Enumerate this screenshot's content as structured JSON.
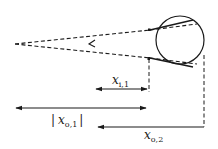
{
  "diagram": {
    "type": "optics-ray-diagram",
    "elements": {
      "circle": {
        "cx": 180,
        "cy": 40,
        "r": 24
      },
      "colors": {
        "stroke": "#1a1a1a",
        "background": "#ffffff"
      }
    },
    "labels": {
      "xi1": {
        "main": "x",
        "sub": "i,1"
      },
      "xo1": {
        "main": "x",
        "sub": "o,1",
        "abs_open": "|",
        "abs_close": "|"
      },
      "xo2": {
        "main": "x",
        "sub": "o,2"
      }
    },
    "arrows": [
      {
        "name": "x_i,1",
        "from": 148,
        "to": 95,
        "y": 89,
        "heads": "both"
      },
      {
        "name": "|x_o,1|",
        "from": 15,
        "to": 147,
        "y": 108,
        "heads": "both"
      },
      {
        "name": "x_o,2",
        "from": 203,
        "to": 97,
        "y": 127,
        "heads": "left"
      }
    ]
  }
}
